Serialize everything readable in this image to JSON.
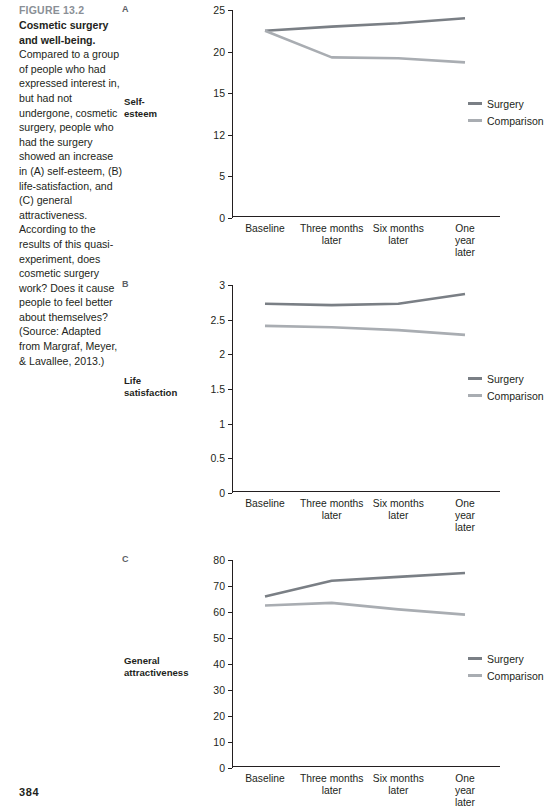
{
  "caption": {
    "figure_number": "FIGURE 13.2",
    "lead": "Cosmetic surgery and well-being.",
    "body": " Compared to a group of people who had expressed interest in, but had not undergone, cosmetic surgery, people who had the surgery showed an increase in (A) self-esteem, (B) life-satisfaction, and (C) general attractiveness. According to the results of this quasi-experiment, does cosmetic surgery work? Does it cause people to feel better about themselves? (Source: Adapted from Margraf, Meyer, & Lavallee, 2013.)"
  },
  "page_number": "384",
  "colors": {
    "surgery": "#7a7f85",
    "comparison": "#a9adb2",
    "axis": "#231f20",
    "figure_number": "#8a8f96"
  },
  "legend": {
    "surgery_label": "Surgery",
    "comparison_label": "Comparison"
  },
  "categories": [
    "Baseline",
    "Three months\nlater",
    "Six months\nlater",
    "One year\nlater"
  ],
  "chart_data": [
    {
      "type": "line",
      "panel": "A",
      "title": "Self-\nesteem",
      "categories": [
        "Baseline",
        "Three months later",
        "Six months later",
        "One year later"
      ],
      "series": [
        {
          "name": "Surgery",
          "values": [
            22.5,
            23.0,
            23.4,
            24.0
          ]
        },
        {
          "name": "Comparison",
          "values": [
            22.5,
            19.3,
            19.2,
            18.7
          ]
        }
      ],
      "yticks": [
        0,
        5,
        12,
        15,
        20,
        25
      ],
      "ytick_labels": [
        "0",
        "5",
        "12",
        "15",
        "20",
        "25"
      ],
      "ylim": [
        0,
        25
      ],
      "xlabel": "",
      "ylabel": "Self-esteem",
      "grid": false,
      "legend_position": "right"
    },
    {
      "type": "line",
      "panel": "B",
      "title": "Life\nsatisfaction",
      "categories": [
        "Baseline",
        "Three months later",
        "Six months later",
        "One year later"
      ],
      "series": [
        {
          "name": "Surgery",
          "values": [
            2.73,
            2.71,
            2.73,
            2.87
          ]
        },
        {
          "name": "Comparison",
          "values": [
            2.41,
            2.39,
            2.35,
            2.28
          ]
        }
      ],
      "yticks": [
        0,
        0.5,
        1,
        1.5,
        2,
        2.5,
        3
      ],
      "ytick_labels": [
        "0",
        "0.5",
        "1",
        "1.5",
        "2",
        "2.5",
        "3"
      ],
      "ylim": [
        0,
        3
      ],
      "xlabel": "",
      "ylabel": "Life satisfaction",
      "grid": false,
      "legend_position": "right"
    },
    {
      "type": "line",
      "panel": "C",
      "title": "General\nattractiveness",
      "categories": [
        "Baseline",
        "Three months later",
        "Six months later",
        "One year later"
      ],
      "series": [
        {
          "name": "Surgery",
          "values": [
            66,
            72,
            73.5,
            75
          ]
        },
        {
          "name": "Comparison",
          "values": [
            62.5,
            63.5,
            61,
            59
          ]
        }
      ],
      "yticks": [
        0,
        10,
        20,
        30,
        40,
        50,
        60,
        70,
        80
      ],
      "ytick_labels": [
        "0",
        "10",
        "20",
        "30",
        "40",
        "50",
        "60",
        "70",
        "80"
      ],
      "ylim": [
        0,
        80
      ],
      "xlabel": "",
      "ylabel": "General attractiveness",
      "grid": false,
      "legend_position": "right"
    }
  ]
}
